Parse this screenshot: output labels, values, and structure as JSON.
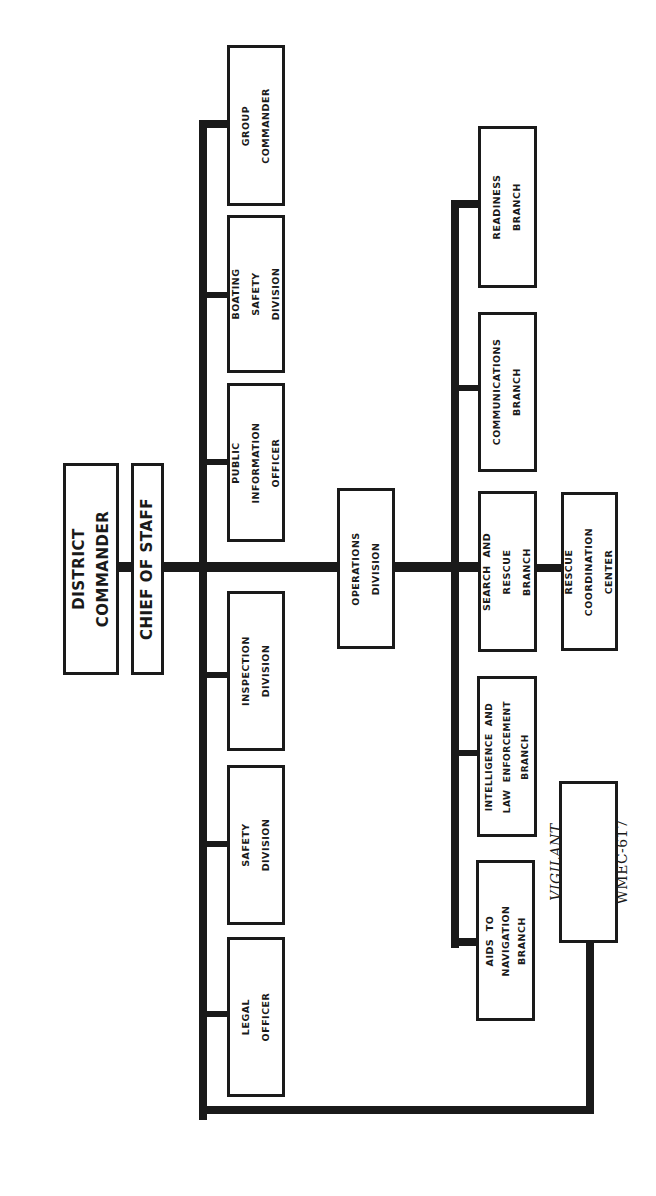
{
  "chart_title": "",
  "orientation": "rotated-90-ccw",
  "colors": {
    "line": "#1a1a1a",
    "box_fill": "#ffffff",
    "background": "#ffffff"
  },
  "top": {
    "district_commander": "DISTRICT\nCOMMANDER",
    "chief_of_staff": "CHIEF OF STAFF"
  },
  "staff_units": [
    {
      "label": "GROUP\nCOMMANDER"
    },
    {
      "label": "BOATING\nSAFETY\nDIVISION"
    },
    {
      "label": "PUBLIC\nINFORMATION\nOFFICER"
    },
    {
      "label": "INSPECTION\nDIVISION"
    },
    {
      "label": "SAFETY\nDIVISION"
    },
    {
      "label": "LEGAL\nOFFICER"
    }
  ],
  "operations": {
    "label": "OPERATIONS\nDIVISION"
  },
  "branches": [
    {
      "label": "READINESS\nBRANCH"
    },
    {
      "label": "COMMUNICATIONS\nBRANCH"
    },
    {
      "label": "SEARCH  AND\nRESCUE\nBRANCH"
    },
    {
      "label": "INTELLIGENCE  AND\nLAW  ENFORCEMENT\nBRANCH"
    },
    {
      "label": "AIDS  TO\nNAVIGATION\nBRANCH"
    }
  ],
  "rescue_center": {
    "label": "RESCUE\nCOORDINATION\nCENTER"
  },
  "vessel": {
    "name": "VIGILANT",
    "hull": "WMEC-617"
  }
}
